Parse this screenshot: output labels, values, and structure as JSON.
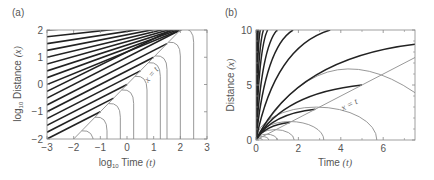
{
  "chart_data": [
    {
      "panel": "(a)",
      "type": "line",
      "title": "",
      "xlabel": "log10 Time (t)",
      "ylabel": "log10 Distance (x)",
      "xlabel_parts": {
        "pre": "log",
        "sub": "10",
        "mid": " Time ",
        "var": "(t)"
      },
      "ylabel_parts": {
        "pre": "log",
        "sub": "10",
        "mid": " Distance ",
        "var": "(x)"
      },
      "xlim": [
        -3,
        3
      ],
      "ylim": [
        -2,
        2
      ],
      "xticks": [
        "-3",
        "-2",
        "-1",
        "0",
        "1",
        "2",
        "3"
      ],
      "yticks": [
        "-2",
        "-1",
        "0",
        "1",
        "2"
      ],
      "grid": false,
      "annotation": "x = t",
      "series": [
        {
          "name": "x = t (log-log diagonal)",
          "color": "#999999",
          "style": "thin gray line",
          "points": [
            [
              -2,
              -2
            ],
            [
              2,
              2
            ]
          ]
        },
        {
          "name": "black characteristics (above x=t)",
          "color": "#222222",
          "style": "thick black, parallel slope ~0.5, spaced ~0.25 decades",
          "count": 22
        },
        {
          "name": "gray curves (below x=t)",
          "color": "#888888",
          "style": "thin gray, turning vertical at t",
          "vertical_asymptotes_log10_t": [
            -1.7,
            -1.25,
            -0.75,
            -0.25,
            0.25,
            0.75,
            1.25,
            1.5,
            2.0,
            2.5
          ]
        }
      ]
    },
    {
      "panel": "(b)",
      "type": "line",
      "title": "",
      "xlabel": "Time (t)",
      "ylabel": "Distance (x)",
      "xlabel_parts": {
        "mid": "Time ",
        "var": "(t)"
      },
      "ylabel_parts": {
        "mid": "Distance ",
        "var": "(x)"
      },
      "xlim": [
        0,
        7.5
      ],
      "ylim": [
        0,
        10
      ],
      "xticks": [
        "0",
        "2",
        "4",
        "6"
      ],
      "yticks": [
        "0",
        "5",
        "10"
      ],
      "grid": false,
      "annotation": "x = t",
      "series": [
        {
          "name": "x = t",
          "color": "#999999",
          "style": "thin gray line",
          "points": [
            [
              0,
              0
            ],
            [
              7.5,
              7.5
            ]
          ]
        },
        {
          "name": "black fan curves from origin",
          "color": "#222222",
          "style": "thick black, concave",
          "endpoints_x_at_top_or_right": [
            [
              0.05,
              10
            ],
            [
              0.1,
              10
            ],
            [
              0.2,
              10
            ],
            [
              0.35,
              10
            ],
            [
              0.55,
              10
            ],
            [
              1.0,
              10
            ],
            [
              1.75,
              10
            ],
            [
              3.5,
              10
            ],
            [
              7.5,
              8.7
            ],
            [
              5.0,
              5.0
            ],
            [
              2.8,
              2.8
            ],
            [
              1.6,
              1.6
            ]
          ]
        },
        {
          "name": "gray semi-elliptic arcs",
          "color": "#888888",
          "style": "thin gray",
          "zero_crossings_t": [
            0.3,
            0.6,
            1.0,
            1.8,
            3.2,
            5.7
          ],
          "peaks": [
            [
              0.15,
              0.15
            ],
            [
              0.3,
              0.3
            ],
            [
              0.5,
              0.5
            ],
            [
              0.9,
              0.9
            ],
            [
              1.6,
              1.6
            ],
            [
              2.8,
              2.8
            ],
            [
              5.0,
              5.0
            ]
          ]
        }
      ]
    }
  ],
  "colors": {
    "black_curve": "#222222",
    "gray_curve": "#8c8c8c",
    "axis": "#777777",
    "text": "#555555"
  }
}
